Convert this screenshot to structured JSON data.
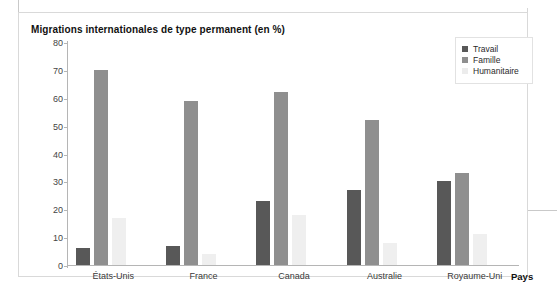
{
  "chart_data": {
    "type": "bar",
    "title": "Migrations internationales de type permanent (en %)",
    "xlabel": "Pays",
    "ylabel": "",
    "ylim": [
      0,
      80
    ],
    "yticks": [
      80,
      70,
      60,
      50,
      40,
      30,
      20,
      10,
      0
    ],
    "grid": false,
    "legend_position": "top-right",
    "categories": [
      "États-Unis",
      "France",
      "Canada",
      "Australie",
      "Royaume-Uni"
    ],
    "series": [
      {
        "name": "Travail",
        "color": "#585858",
        "values": [
          6,
          7,
          23,
          27,
          30
        ]
      },
      {
        "name": "Famille",
        "color": "#8f8f8f",
        "values": [
          70,
          59,
          62,
          52,
          33
        ]
      },
      {
        "name": "Humanitaire",
        "color": "#efefef",
        "values": [
          17,
          4,
          18,
          8,
          11
        ]
      }
    ]
  }
}
